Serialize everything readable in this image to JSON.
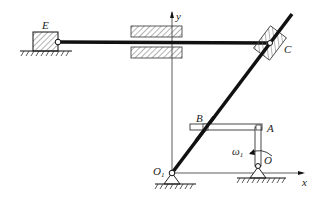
{
  "diagram": {
    "type": "planar mechanism (quick-return / slider-crank)",
    "labels": {
      "E": "E",
      "C": "C",
      "B": "B",
      "A": "A",
      "O": "O",
      "O1": "O",
      "O1_sub": "1",
      "x_axis": "x",
      "y_axis": "y",
      "omega": "ω",
      "omega_sub": "1"
    },
    "colors": {
      "line": "#111111",
      "hatch": "#666666",
      "background": "#ffffff"
    }
  }
}
